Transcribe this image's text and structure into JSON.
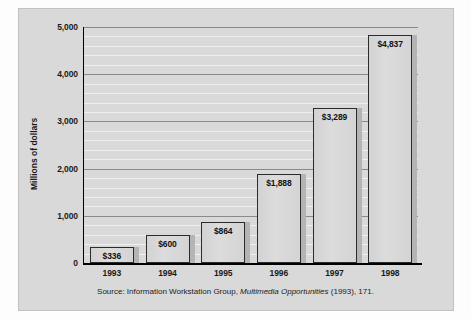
{
  "chart_data": {
    "type": "bar",
    "title": "",
    "xlabel": "",
    "ylabel": "Millions of dollars",
    "categories": [
      "1993",
      "1994",
      "1995",
      "1996",
      "1997",
      "1998"
    ],
    "values": [
      336,
      600,
      864,
      1888,
      3289,
      4837
    ],
    "data_labels": [
      "$336",
      "$600",
      "$864",
      "$1,888",
      "$3,289",
      "$4,837"
    ],
    "ylim": [
      0,
      5000
    ],
    "ytick_values": [
      0,
      1000,
      2000,
      3000,
      4000,
      5000
    ],
    "ytick_labels": [
      "0",
      "1,000",
      "2,000",
      "3,000",
      "4,000",
      "5,000"
    ],
    "minor_tick_interval": 200,
    "grid": true,
    "legend": "none",
    "bar_color": "#d8d8d8",
    "bar_border_color": "#2b2b2b",
    "panel_color": "#d9d9d9"
  },
  "source": {
    "prefix": "Source: Information Workstation Group, ",
    "italic_title": "Multimedia Opportunities",
    "suffix": " (1993), 171."
  }
}
